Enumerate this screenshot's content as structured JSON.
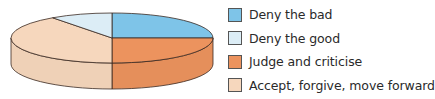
{
  "chart_data": {
    "type": "pie",
    "style": "3d",
    "title": "",
    "legend_position": "right",
    "categories": [
      "Deny the bad",
      "Deny the good",
      "Judge and criticise",
      "Accept, forgive, move forward"
    ],
    "values": [
      25,
      10,
      25,
      40
    ],
    "colors": [
      "#7ec4e8",
      "#dcedf6",
      "#ec935e",
      "#f6d7bd"
    ],
    "slice_order_clockwise_from_top": [
      "Deny the bad",
      "Judge and criticise",
      "Accept, forgive, move forward",
      "Deny the good"
    ]
  },
  "legend": {
    "items": [
      {
        "label": "Deny the bad",
        "color": "#7ec4e8"
      },
      {
        "label": "Deny the good",
        "color": "#dcedf6"
      },
      {
        "label": "Judge and criticise",
        "color": "#ec935e"
      },
      {
        "label": "Accept, forgive, move forward",
        "color": "#f6d7bd"
      }
    ]
  }
}
